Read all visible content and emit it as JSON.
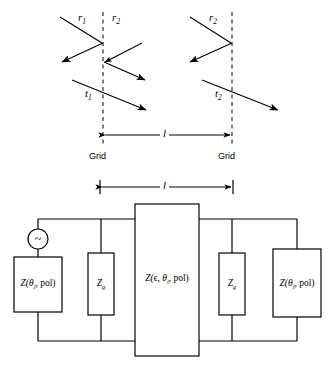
{
  "figure": {
    "line_color": "#000000",
    "background": "#ffffff"
  },
  "ray_diagram": {
    "labels": {
      "r1": "r",
      "r1_sub": "1",
      "r2_left": "r",
      "r2_left_sub": "2",
      "r2_right": "r",
      "r2_right_sub": "2",
      "t1": "t",
      "t1_sub": "1",
      "t2": "t",
      "t2_sub": "2"
    },
    "grid_left_label": "Grid",
    "grid_right_label": "Grid",
    "spacing_label": "l"
  },
  "circuit": {
    "spacing_label": "l",
    "source": {
      "name": "ac-source",
      "symbol": "~"
    },
    "blocks": [
      {
        "id": "z-left-termination",
        "prefix": "Z(",
        "theta": "θ",
        "theta_sub": "i",
        "suffix": ", pol)"
      },
      {
        "id": "z-grid-left",
        "prefix": "Z",
        "sub": "g"
      },
      {
        "id": "z-slab",
        "prefix": "Z(",
        "eps": "ϵ",
        "mid": ", ",
        "theta": "θ",
        "theta_sub": "i",
        "suffix": ", pol)"
      },
      {
        "id": "z-grid-right",
        "prefix": "Z",
        "sub": "g"
      },
      {
        "id": "z-right-termination",
        "prefix": "Z(",
        "theta": "θ",
        "theta_sub": "i",
        "suffix": ", pol)"
      }
    ]
  }
}
